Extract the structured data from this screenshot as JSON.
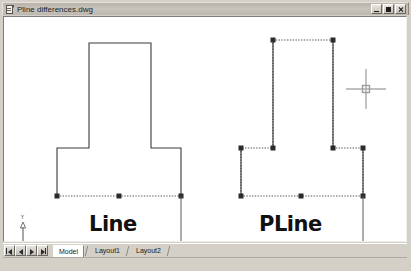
{
  "window": {
    "title": "Pline differences.dwg",
    "icon": "dwg-document-icon",
    "controls": [
      {
        "name": "minimize-button",
        "glyph": "minimize"
      },
      {
        "name": "maximize-button",
        "glyph": "maximize"
      },
      {
        "name": "close-button",
        "glyph": "close"
      }
    ]
  },
  "canvas": {
    "background_color": "#ffffff",
    "cursor": {
      "type": "crosshair-with-pickbox",
      "x": 365,
      "y": 88,
      "color": "#9a9a9a"
    },
    "ucs_icon": {
      "x_label": "X",
      "y_label": "Y",
      "origin_marker": "square",
      "color": "#6e6e6e"
    },
    "objects": [
      {
        "name": "line-entity-group",
        "label": "Line",
        "label_x": 85,
        "label_y": 195,
        "style": "solid",
        "line_color": "#3a3a3a",
        "selected_segment": "bottom-edge",
        "selected_style": "dashed-highlight",
        "grips": [
          {
            "x": 56,
            "y": 195
          },
          {
            "x": 118,
            "y": 195
          },
          {
            "x": 180,
            "y": 195
          }
        ],
        "vertices": [
          {
            "x": 88,
            "y": 42
          },
          {
            "x": 150,
            "y": 42
          },
          {
            "x": 150,
            "y": 147
          },
          {
            "x": 180,
            "y": 147
          },
          {
            "x": 180,
            "y": 195
          },
          {
            "x": 56,
            "y": 195
          },
          {
            "x": 56,
            "y": 147
          },
          {
            "x": 88,
            "y": 147
          }
        ]
      },
      {
        "name": "pline-entity-group",
        "label": "PLine",
        "label_x": 255,
        "label_y": 195,
        "style": "dashed",
        "line_color": "#3a3a3a",
        "selected_segment": "all",
        "selected_style": "dashed-highlight",
        "grips": [
          {
            "x": 272,
            "y": 39
          },
          {
            "x": 332,
            "y": 39
          },
          {
            "x": 332,
            "y": 147
          },
          {
            "x": 362,
            "y": 147
          },
          {
            "x": 362,
            "y": 195
          },
          {
            "x": 240,
            "y": 195
          },
          {
            "x": 240,
            "y": 147
          },
          {
            "x": 272,
            "y": 147
          }
        ],
        "vertices": [
          {
            "x": 272,
            "y": 39
          },
          {
            "x": 332,
            "y": 39
          },
          {
            "x": 332,
            "y": 147
          },
          {
            "x": 362,
            "y": 147
          },
          {
            "x": 362,
            "y": 195
          },
          {
            "x": 240,
            "y": 195
          },
          {
            "x": 240,
            "y": 147
          },
          {
            "x": 272,
            "y": 147
          }
        ]
      }
    ],
    "leader_lines": [
      {
        "name": "line-leader",
        "x": 180,
        "y1": 195,
        "y2": 245
      },
      {
        "name": "pline-leader",
        "x": 362,
        "y1": 195,
        "y2": 245
      }
    ],
    "grip_color": "#2b2b2b"
  },
  "tabs": {
    "nav_buttons": [
      {
        "name": "tab-first-button",
        "glyph": "first"
      },
      {
        "name": "tab-prev-button",
        "glyph": "prev"
      },
      {
        "name": "tab-next-button",
        "glyph": "next"
      },
      {
        "name": "tab-last-button",
        "glyph": "last"
      }
    ],
    "items": [
      {
        "label": "Model",
        "active": true
      },
      {
        "label": "Layout1",
        "active": false
      },
      {
        "label": "Layout2",
        "active": false
      }
    ]
  }
}
